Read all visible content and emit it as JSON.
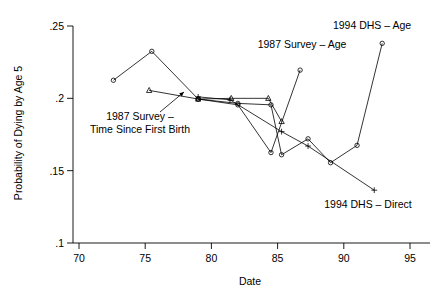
{
  "chart_data": {
    "type": "line",
    "title": "",
    "xlabel": "Date",
    "ylabel": "Probability of Dying by Age 5",
    "xlim": [
      70,
      96
    ],
    "ylim": [
      0.1,
      0.255
    ],
    "grid": false,
    "legend_position": "inline-annotations",
    "xticks": [
      70,
      75,
      80,
      85,
      90,
      95
    ],
    "xticklabels": [
      "70",
      "75",
      "80",
      "85",
      "90",
      "95"
    ],
    "yticks": [
      0.1,
      0.15,
      0.2,
      0.25
    ],
    "yticklabels": [
      ".1",
      ".15",
      ".2",
      ".25"
    ],
    "series": [
      {
        "name": "1987 Survey - Age",
        "marker": "circle",
        "x": [
          72.6,
          75.5,
          79.0,
          82.0,
          84.5,
          86.7
        ],
        "y": [
          0.2125,
          0.2325,
          0.1995,
          0.1955,
          0.1625,
          0.2195
        ]
      },
      {
        "name": "1987 Survey - Time Since First Birth",
        "marker": "triangle",
        "x": [
          75.3,
          79.0,
          81.5,
          84.3,
          85.3
        ],
        "y": [
          0.2055,
          0.1995,
          0.2,
          0.2,
          0.184
        ]
      },
      {
        "name": "1994 DHS - Age",
        "marker": "circle",
        "x": [
          79.0,
          82.0,
          84.5,
          85.3,
          87.3,
          89.0,
          91.0,
          92.9
        ],
        "y": [
          0.1995,
          0.1965,
          0.1955,
          0.161,
          0.172,
          0.1555,
          0.1675,
          0.238
        ]
      },
      {
        "name": "1994 DHS - Direct",
        "marker": "plus",
        "x": [
          79.0,
          81.4,
          85.3,
          87.3,
          92.3
        ],
        "y": [
          0.201,
          0.199,
          0.177,
          0.167,
          0.1365
        ]
      }
    ],
    "annotations": [
      {
        "id": "annot-1987-survey-tsfb",
        "lines": [
          "1987 Survey –",
          "Time Since First Birth"
        ],
        "text_x": 140,
        "text_y": 120,
        "anchor": "middle",
        "leader": {
          "x1": 160,
          "y1": 112,
          "x2": 184,
          "y2": 92
        }
      },
      {
        "id": "annot-1987-survey-age",
        "lines": [
          "1987 Survey – Age"
        ],
        "text_x": 302,
        "text_y": 48,
        "anchor": "middle",
        "leader": null
      },
      {
        "id": "annot-1994-dhs-age",
        "lines": [
          "1994 DHS – Age"
        ],
        "text_x": 372,
        "text_y": 29,
        "anchor": "middle",
        "leader": null
      },
      {
        "id": "annot-1994-dhs-direct",
        "lines": [
          "1994 DHS – Direct"
        ],
        "text_x": 368,
        "text_y": 208,
        "anchor": "middle",
        "leader": null
      }
    ]
  }
}
